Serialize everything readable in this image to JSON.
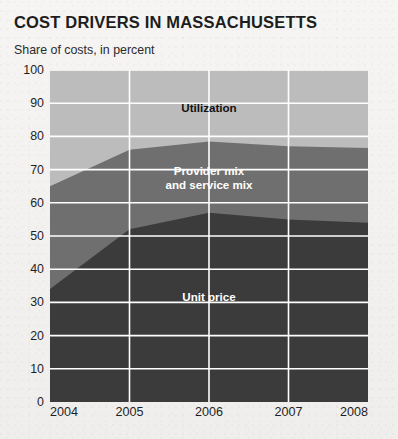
{
  "title": "COST DRIVERS IN MASSACHUSETTS",
  "subtitle": "Share of costs, in percent",
  "colors": {
    "utilization": "#bcbcbc",
    "provider_mix": "#6f6f6f",
    "unit_price": "#3b3b3b",
    "gridline": "#ffffff",
    "background": "#f4f3f1",
    "title_text": "#1d1d1d"
  },
  "labels": {
    "utilization": "Utilization",
    "provider_line1": "Provider mix",
    "provider_line2": "and service mix",
    "unit_price": "Unit price"
  },
  "chart_data": {
    "type": "area",
    "stacked": true,
    "title": "COST DRIVERS IN MASSACHUSETTS",
    "subtitle": "Share of costs, in percent",
    "xlabel": "",
    "ylabel": "Share of costs, in percent",
    "x": [
      2004,
      2005,
      2006,
      2007,
      2008
    ],
    "categories": [
      "2004",
      "2005",
      "2006",
      "2007",
      "2008"
    ],
    "xtick_labels": [
      "2004",
      "2005",
      "2006",
      "2007",
      "2008"
    ],
    "ytick_labels": [
      "0",
      "10",
      "20",
      "30",
      "40",
      "50",
      "60",
      "70",
      "80",
      "90",
      "100"
    ],
    "yticks": [
      0,
      10,
      20,
      30,
      40,
      50,
      60,
      70,
      80,
      90,
      100
    ],
    "ylim": [
      0,
      100
    ],
    "xlim": [
      2004,
      2008
    ],
    "grid": true,
    "legend": "inline-labels",
    "series": [
      {
        "name": "Unit price",
        "color": "#3b3b3b",
        "values": [
          34,
          52,
          57,
          55,
          54
        ],
        "cumulative_top": [
          34,
          52,
          57,
          55,
          54
        ]
      },
      {
        "name": "Provider mix and service mix",
        "color": "#6f6f6f",
        "values": [
          31,
          24,
          21.5,
          22,
          22.5
        ],
        "cumulative_top": [
          65,
          76,
          78.5,
          77,
          76.5
        ]
      },
      {
        "name": "Utilization",
        "color": "#bcbcbc",
        "values": [
          35,
          24,
          21.5,
          23,
          23.5
        ],
        "cumulative_top": [
          100,
          100,
          100,
          100,
          100
        ]
      }
    ]
  }
}
